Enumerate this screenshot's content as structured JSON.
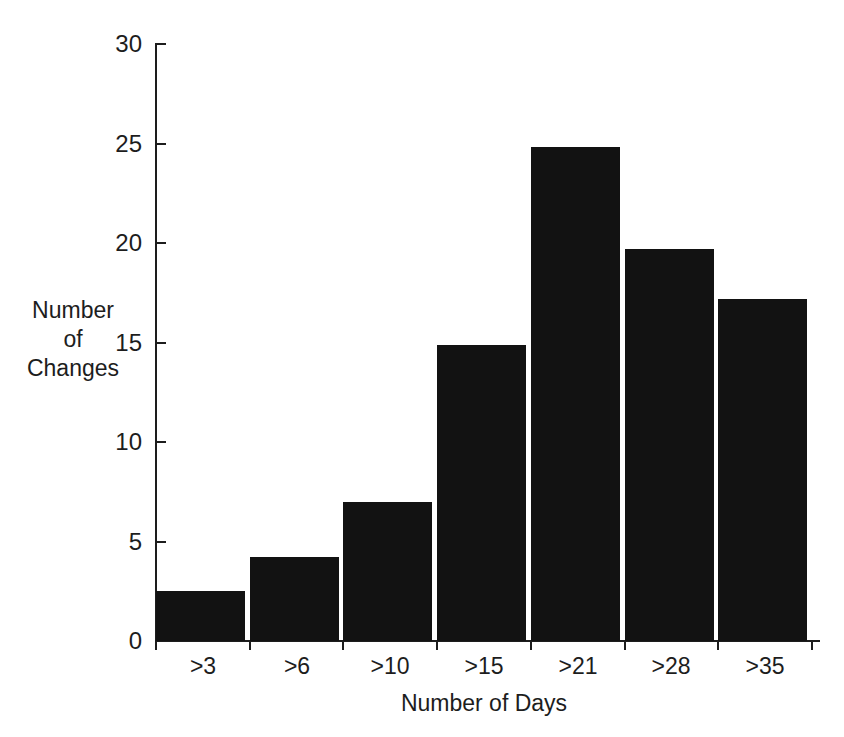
{
  "chart_data": {
    "type": "bar",
    "title": "",
    "subtitle": "",
    "xlabel": "Number of Days",
    "ylabel_lines": [
      "Number",
      "of",
      "Changes"
    ],
    "ylabel": "Number of Changes",
    "categories": [
      ">3",
      ">6",
      ">10",
      ">15",
      ">21",
      ">28",
      ">35"
    ],
    "values": [
      2.5,
      4.2,
      7.0,
      14.9,
      24.8,
      19.7,
      17.2
    ],
    "ylim": [
      0,
      30
    ],
    "yticks": [
      0,
      5,
      10,
      15,
      20,
      25,
      30
    ],
    "ytick_labels": [
      "0",
      "5",
      "10",
      "15",
      "20",
      "25",
      "30"
    ],
    "grid": false,
    "legend": null,
    "bar_color": "#121212",
    "axis_color": "#1d1d1d",
    "background_color": "#ffffff"
  }
}
